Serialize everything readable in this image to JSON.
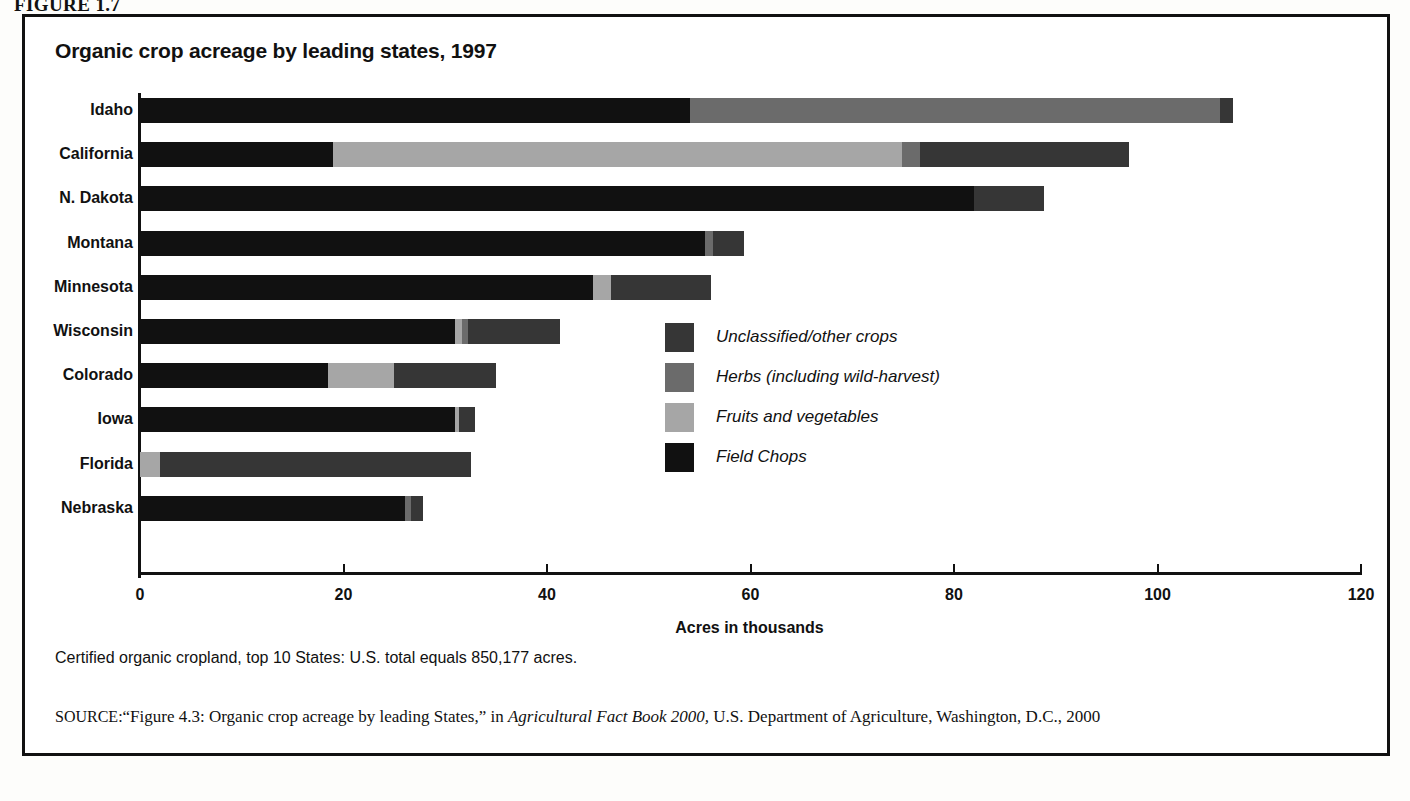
{
  "figure": {
    "label": "FIGURE 1.7"
  },
  "chart_title": "Organic crop acreage by leading states, 1997",
  "axis": {
    "xlabel": "Acres in thousands",
    "ticks": [
      "0",
      "20",
      "40",
      "60",
      "80",
      "100",
      "120"
    ]
  },
  "legend": {
    "position": "inside-right",
    "items": [
      {
        "label": "Unclassified/other crops",
        "color": "#363636",
        "key": "unclassified"
      },
      {
        "label": "Herbs (including wild-harvest)",
        "color": "#6b6b6b",
        "key": "herbs"
      },
      {
        "label": "Fruits and vegetables",
        "color": "#a6a6a6",
        "key": "fruits"
      },
      {
        "label": "Field Chops",
        "color": "#111111",
        "key": "field"
      }
    ]
  },
  "notes": {
    "footnote": "Certified organic cropland, top 10 States: U.S. total equals 850,177 acres.",
    "source_prefix": "SOURCE:",
    "source_part1": "“Figure 4.3: Organic crop acreage by leading States,” in ",
    "source_italic": "Agricultural Fact Book 2000,",
    "source_part2": " U.S. Department of Agriculture, Washington, D.C., 2000"
  },
  "chart_data": {
    "type": "bar",
    "orientation": "horizontal",
    "stacked": true,
    "title": "Organic crop acreage by leading states, 1997",
    "xlabel": "Acres in thousands",
    "ylabel": "",
    "xlim": [
      0,
      120
    ],
    "xticks": [
      0,
      20,
      40,
      60,
      80,
      100,
      120
    ],
    "grid": false,
    "legend_position": "inside-right",
    "categories": [
      "Idaho",
      "California",
      "N. Dakota",
      "Montana",
      "Minnesota",
      "Wisconsin",
      "Colorado",
      "Iowa",
      "Florida",
      "Nebraska"
    ],
    "series": [
      {
        "name": "Field Chops",
        "color": "#111111",
        "values": [
          54.1,
          19.0,
          82.0,
          55.5,
          44.5,
          31.0,
          18.5,
          31.0,
          0.0,
          26.0
        ]
      },
      {
        "name": "Fruits and vegetables",
        "color": "#a6a6a6",
        "values": [
          0.0,
          55.9,
          0.0,
          0.0,
          1.8,
          0.6,
          6.5,
          0.4,
          2.0,
          0.0
        ]
      },
      {
        "name": "Herbs (including wild-harvest)",
        "color": "#6b6b6b",
        "values": [
          52.0,
          1.8,
          0.0,
          0.8,
          0.0,
          0.6,
          0.0,
          0.0,
          0.0,
          0.6
        ]
      },
      {
        "name": "Unclassified/other crops",
        "color": "#363636",
        "values": [
          1.3,
          20.5,
          6.8,
          3.1,
          9.8,
          9.1,
          10.0,
          1.5,
          30.5,
          1.2
        ]
      }
    ],
    "totals": [
      107.4,
      97.2,
      88.8,
      59.4,
      56.1,
      41.3,
      35.0,
      32.9,
      32.5,
      27.8
    ]
  }
}
